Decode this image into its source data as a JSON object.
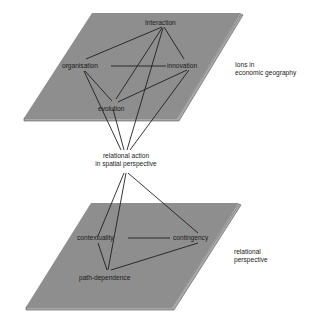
{
  "diagram": {
    "top_plane": {
      "nodes": [
        {
          "id": "interaction",
          "label": "Interaction"
        },
        {
          "id": "organisation",
          "label": "organisation"
        },
        {
          "id": "innovation",
          "label": "innovation"
        },
        {
          "id": "evolution",
          "label": "evolution"
        }
      ],
      "side_label": [
        "Ions in",
        "economic geography"
      ]
    },
    "center": {
      "label": [
        "relational action",
        "in spatial perspective"
      ]
    },
    "bottom_plane": {
      "nodes": [
        {
          "id": "contextuality",
          "label": "contextuality"
        },
        {
          "id": "contingency",
          "label": "contingency"
        },
        {
          "id": "path-dependence",
          "label": "path-dependence"
        }
      ],
      "side_label": [
        "relational",
        "perspective"
      ]
    },
    "edges": [
      [
        "interaction",
        "organisation"
      ],
      [
        "interaction",
        "innovation"
      ],
      [
        "interaction",
        "evolution"
      ],
      [
        "organisation",
        "innovation"
      ],
      [
        "organisation",
        "evolution"
      ],
      [
        "innovation",
        "evolution"
      ],
      [
        "center",
        "organisation"
      ],
      [
        "center",
        "evolution"
      ],
      [
        "center",
        "interaction"
      ],
      [
        "center",
        "innovation"
      ],
      [
        "center",
        "contextuality"
      ],
      [
        "center",
        "path-dependence"
      ],
      [
        "center",
        "contingency"
      ],
      [
        "contextuality",
        "contingency"
      ],
      [
        "contextuality",
        "path-dependence"
      ],
      [
        "contingency",
        "path-dependence"
      ]
    ],
    "colors": {
      "plane": "#8e8e8e",
      "line": "#1f1f1f",
      "text": "#1a1a1a"
    }
  }
}
